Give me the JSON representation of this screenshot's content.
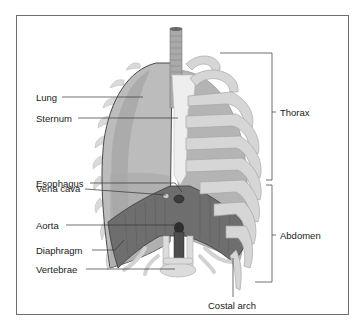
{
  "diagram": {
    "title": "",
    "colors": {
      "frame": "#6e6e6e",
      "lung": "#b9b9b9",
      "lung_shadow": "#9a9a9a",
      "rib": "#d8d8d8",
      "rib_edge": "#a8a8a8",
      "sternum": "#ececec",
      "trachea": "#a0a0a0",
      "diaphragm": "#6a6a6a",
      "vertebrae": "#dcdcdc",
      "leader_line": "#333333"
    },
    "left_labels": [
      {
        "id": "lung",
        "text": "Lung"
      },
      {
        "id": "sternum",
        "text": "Sternum"
      },
      {
        "id": "esophagus",
        "text": "Esophagus"
      },
      {
        "id": "vena-cava",
        "text": "Vena cava"
      },
      {
        "id": "aorta",
        "text": "Aorta"
      },
      {
        "id": "diaphragm",
        "text": "Diaphragm"
      },
      {
        "id": "vertebrae",
        "text": "Vertebrae"
      }
    ],
    "right_labels": [
      {
        "id": "thorax",
        "text": "Thorax"
      },
      {
        "id": "abdomen",
        "text": "Abdomen"
      }
    ],
    "bottom_labels": [
      {
        "id": "costal-arch",
        "text": "Costal arch"
      }
    ]
  }
}
